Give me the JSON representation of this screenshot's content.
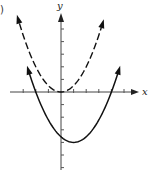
{
  "figure": {
    "corner_label": ")",
    "x_axis_label": "x",
    "y_axis_label": "y"
  },
  "chart_data": {
    "type": "line",
    "title": "",
    "xlabel": "x",
    "ylabel": "y",
    "x_ticks": [
      -3,
      -2,
      -1,
      1,
      2,
      3,
      4,
      5
    ],
    "y_ticks": [
      -6,
      -5,
      -4,
      -3,
      -2,
      -1,
      1,
      2,
      3,
      4,
      5
    ],
    "xlim": [
      -3.5,
      6
    ],
    "ylim": [
      -6.2,
      6.8
    ],
    "grid": false,
    "series": [
      {
        "name": "dashed parabola",
        "style": "dashed",
        "equation": "y = 0.5 x^2",
        "vertex": [
          0,
          0
        ],
        "x": [
          -3.5,
          -2,
          -1,
          0,
          1,
          2,
          3.4
        ],
        "y": [
          6.1,
          2,
          0.5,
          0,
          0.5,
          2,
          5.8
        ]
      },
      {
        "name": "solid parabola",
        "style": "solid",
        "equation": "y = (4/9)(x + 2)(x - 4)",
        "vertex": [
          1,
          -4
        ],
        "x_intercepts": [
          -2,
          4
        ],
        "x": [
          -2.7,
          -2,
          -1,
          0,
          1,
          2,
          3,
          4,
          4.7
        ],
        "y": [
          2.2,
          0,
          -2.2,
          -3.6,
          -4,
          -3.6,
          -2.2,
          0,
          2.2
        ]
      }
    ]
  },
  "style": {
    "line_color": "#111111",
    "axis_color": "#444444",
    "background": "#ffffff"
  }
}
